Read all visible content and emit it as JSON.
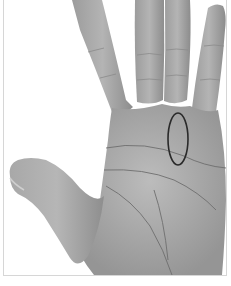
{
  "image": {
    "subject": "palm-of-left-hand",
    "description": "Grayscale photograph of an open palm with fingers spread, with an oval outline marking the area below the ring finger",
    "colors": {
      "background": "#ffffff",
      "skin_light": "#b8b8b8",
      "skin_mid": "#9a9a9a",
      "skin_dark": "#7a7a7a",
      "palm_lines": "#6e6e6e",
      "annotation_oval": "#2a2a2a",
      "frame_border": "#d6d6d6"
    },
    "annotation": {
      "shape": "oval",
      "marks": "mount-below-ring-finger"
    }
  }
}
